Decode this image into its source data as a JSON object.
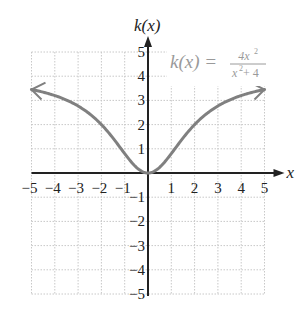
{
  "chart_data": {
    "type": "line",
    "title": "",
    "function_label": "k(x) = 4x^2/(x^2+4)",
    "label_parts": {
      "lhs": "k(x) =",
      "num": "4x",
      "num_exp": "2",
      "den": "x",
      "den_exp": "2",
      "den_rest": " + 4"
    },
    "xlabel": "x",
    "ylabel": "k(x)",
    "xlim": [
      -5,
      5
    ],
    "ylim": [
      -5,
      5
    ],
    "grid": true,
    "x_ticks": [
      "−5",
      "−4",
      "−3",
      "−2",
      "−1",
      "1",
      "2",
      "3",
      "4",
      "5"
    ],
    "y_ticks": [
      "5",
      "4",
      "3",
      "2",
      "1",
      "−1",
      "−2",
      "−3",
      "−4",
      "−5"
    ],
    "series": [
      {
        "name": "k(x)",
        "x": [
          -5,
          -4,
          -3,
          -2,
          -1,
          0,
          1,
          2,
          3,
          4,
          5
        ],
        "values": [
          3.45,
          3.2,
          2.77,
          2.0,
          0.8,
          0,
          0.8,
          2.0,
          2.77,
          3.2,
          3.45
        ]
      }
    ],
    "arrows_both_ends": true,
    "curve_color": "#808080"
  }
}
